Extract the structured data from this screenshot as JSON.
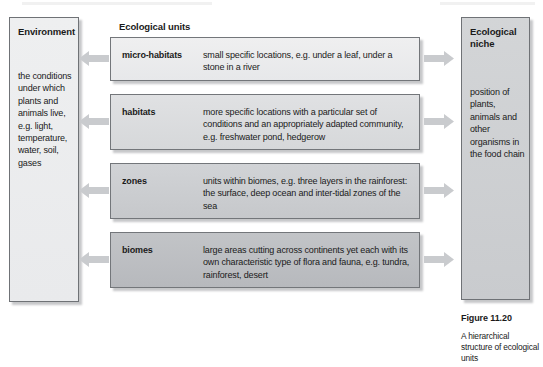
{
  "figure": {
    "caption_label": "Figure 11.20",
    "caption_text": "A hierarchical structure of ecological units"
  },
  "left_panel": {
    "title": "Environment",
    "body": "the conditions under which plants and animals live, e.g. light, temperature, water, soil, gases"
  },
  "middle_column": {
    "heading": "Ecological units",
    "units": [
      {
        "term": "micro-habitats",
        "description": "small specific locations, e.g. under a leaf, under a stone in a river"
      },
      {
        "term": "habitats",
        "description": "more specific locations with a particular set of conditions and an appropriately adapted community, e.g. freshwater pond, hedgerow"
      },
      {
        "term": "zones",
        "description": "units within biomes, e.g. three layers in the rainforest: the surface, deep ocean and inter-tidal zones of the sea"
      },
      {
        "term": "biomes",
        "description": "large areas cutting across continents yet each with its own characteristic type of flora and fauna, e.g. tundra, rainforest, desert"
      }
    ]
  },
  "right_panel": {
    "title": "Ecological niche",
    "body": "position of plants, animals and other organisms in the food chain"
  },
  "arrows": {
    "left_count": 4,
    "right_count": 4,
    "left_direction": "left",
    "right_direction": "right",
    "fill_color": "#c9cbce"
  },
  "colors": {
    "page_background": "#ffffff",
    "box_border": "#73767a",
    "text": "#1a1a1a",
    "micro_habitats_fill": "#ebecee",
    "habitats_fill": "#dbdcdf",
    "zones_fill": "#ccced1",
    "biomes_fill": "#bdbfc2",
    "environment_fill": "#ecedef",
    "niche_fill": "#ced0d3"
  }
}
